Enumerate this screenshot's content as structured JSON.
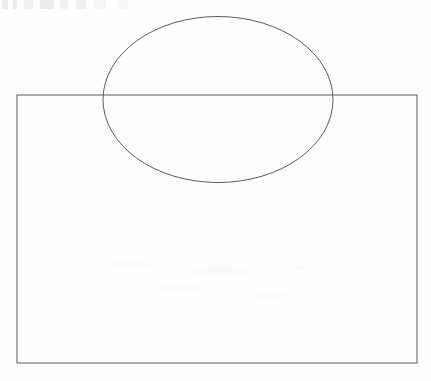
{
  "figure": {
    "canvas": {
      "width": 431,
      "height": 381,
      "background_color": "#fefefe"
    },
    "stroke": {
      "color": "#5a5a5a",
      "width": 1,
      "fill": "none"
    },
    "shapes": [
      {
        "name": "rectangle",
        "type": "rect",
        "x": 17,
        "y": 95,
        "width": 400,
        "height": 268
      },
      {
        "name": "ellipse",
        "type": "ellipse",
        "cx": 218,
        "cy": 99.5,
        "rx": 115,
        "ry": 83
      }
    ],
    "artifacts": [
      {
        "name": "scan-noise-top",
        "description": "faint gray scan marks along top-left edge"
      },
      {
        "name": "scan-noise-middle",
        "description": "faint off-white smudges in lower middle of rectangle"
      }
    ]
  }
}
